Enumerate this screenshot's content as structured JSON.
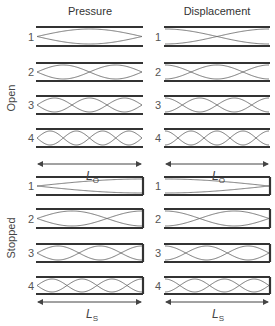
{
  "columns": [
    {
      "key": "pressure",
      "title": "Pressure"
    },
    {
      "key": "displacement",
      "title": "Displacement"
    }
  ],
  "groups": [
    {
      "key": "open",
      "label": "Open",
      "length_label": "L",
      "length_subscript": "O",
      "modes": [
        "1",
        "2",
        "3",
        "4"
      ]
    },
    {
      "key": "stopped",
      "label": "Stopped",
      "length_label": "L",
      "length_subscript": "S",
      "modes": [
        "1",
        "2",
        "3",
        "4"
      ]
    }
  ],
  "colors": {
    "wall": "#333333",
    "wave": "#6a6a6a",
    "text": "#444444"
  }
}
